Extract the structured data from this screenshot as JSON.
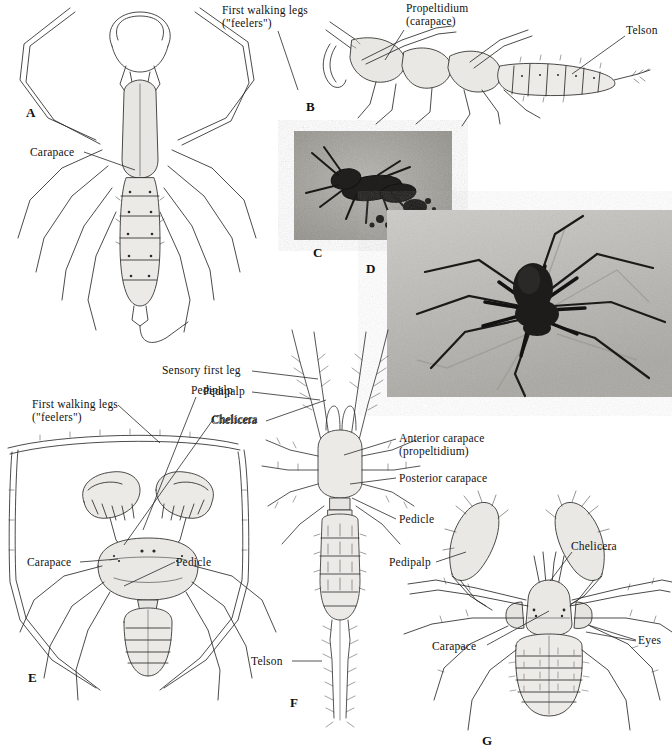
{
  "figure": {
    "background": "#ffffff",
    "ink": "#2a2a2a",
    "plates": [
      {
        "id": "A",
        "x": 26,
        "y": 105
      },
      {
        "id": "B",
        "x": 306,
        "y": 99
      },
      {
        "id": "C",
        "x": 313,
        "y": 245
      },
      {
        "id": "D",
        "x": 366,
        "y": 261
      },
      {
        "id": "E",
        "x": 28,
        "y": 670
      },
      {
        "id": "F",
        "x": 290,
        "y": 695
      },
      {
        "id": "G",
        "x": 482,
        "y": 733
      }
    ],
    "labels": [
      {
        "name": "label-carapace-a",
        "text": "Carapace",
        "x": 30,
        "y": 146,
        "leader": [
          [
            84,
            152
          ],
          [
            135,
            170
          ]
        ]
      },
      {
        "name": "label-first-walking-legs-b",
        "text": "First walking legs\n(\"feelers\")",
        "x": 222,
        "y": 4,
        "leader": [
          [
            278,
            31
          ],
          [
            298,
            90
          ]
        ]
      },
      {
        "name": "label-propeltidium-b",
        "text": "Propeltidium\n(carapace)",
        "x": 406,
        "y": 2,
        "leader": [
          [
            404,
            30
          ],
          [
            385,
            60
          ]
        ]
      },
      {
        "name": "label-telson-b",
        "text": "Telson",
        "x": 626,
        "y": 24,
        "leader": [
          [
            625,
            36
          ],
          [
            572,
            74
          ]
        ]
      },
      {
        "name": "label-sensory-first-leg-f",
        "text": "Sensory first leg",
        "x": 162,
        "y": 364,
        "leader": [
          [
            252,
            371
          ],
          [
            318,
            379
          ]
        ]
      },
      {
        "name": "label-pedipalp-f",
        "text": "Pedipalp",
        "x": 203,
        "y": 385,
        "leader": [
          [
            252,
            392
          ],
          [
            320,
            400
          ]
        ]
      },
      {
        "name": "label-chelicera-f",
        "text": "Chelicera",
        "x": 211,
        "y": 414,
        "leader": [
          [
            266,
            421
          ],
          [
            326,
            400
          ]
        ]
      },
      {
        "name": "label-anterior-carapace-f",
        "text": "Anterior carapace\n(propeltidium)",
        "x": 399,
        "y": 432,
        "leader": [
          [
            396,
            439
          ],
          [
            344,
            455
          ]
        ]
      },
      {
        "name": "label-posterior-carapace-f",
        "text": "Posterior carapace",
        "x": 399,
        "y": 472,
        "leader": [
          [
            396,
            478
          ],
          [
            350,
            484
          ]
        ]
      },
      {
        "name": "label-pedicle-f",
        "text": "Pedicle",
        "x": 399,
        "y": 513,
        "leader": [
          [
            396,
            519
          ],
          [
            352,
            498
          ]
        ]
      },
      {
        "name": "label-telson-f",
        "text": "Telson",
        "x": 251,
        "y": 655,
        "leader": [
          [
            292,
            661
          ],
          [
            322,
            661
          ]
        ]
      },
      {
        "name": "label-first-walking-legs-e",
        "text": "First walking legs\n(\"feelers\")",
        "x": 32,
        "y": 398,
        "leader": [
          [
            118,
            405
          ],
          [
            160,
            443
          ]
        ]
      },
      {
        "name": "label-pedipalp-e",
        "text": "Pedipalp",
        "x": 191,
        "y": 384,
        "leader": [
          [
            196,
            397
          ],
          [
            143,
            530
          ]
        ]
      },
      {
        "name": "label-chelicera-e",
        "text": "Chelicera",
        "x": 212,
        "y": 413,
        "leader": [
          [
            212,
            421
          ],
          [
            124,
            545
          ]
        ]
      },
      {
        "name": "label-carapace-e",
        "text": "Carapace",
        "x": 27,
        "y": 556,
        "leader": [
          [
            80,
            562
          ],
          [
            118,
            559
          ]
        ]
      },
      {
        "name": "label-pedicle-e",
        "text": "Pedicle",
        "x": 176,
        "y": 556,
        "leader": [
          [
            175,
            562
          ],
          [
            124,
            586
          ]
        ]
      },
      {
        "name": "label-pedipalp-g",
        "text": "Pedipalp",
        "x": 389,
        "y": 556,
        "leader": [
          [
            436,
            562
          ],
          [
            466,
            552
          ]
        ]
      },
      {
        "name": "label-chelicera-g",
        "text": "Chelicera",
        "x": 571,
        "y": 540,
        "leader": [
          [
            572,
            552
          ],
          [
            550,
            581
          ]
        ]
      },
      {
        "name": "label-carapace-g",
        "text": "Carapace",
        "x": 432,
        "y": 640,
        "leader": [
          [
            487,
            645
          ],
          [
            549,
            611
          ]
        ]
      },
      {
        "name": "label-eyes-g",
        "text": "Eyes",
        "x": 638,
        "y": 634,
        "leader": [
          [
            636,
            640
          ],
          [
            588,
            625
          ]
        ]
      },
      {
        "name": "label-eyes-g-2",
        "text": "",
        "x": 638,
        "y": 634,
        "leader": [
          [
            636,
            641
          ],
          [
            586,
            632
          ]
        ]
      }
    ],
    "panels": [
      {
        "id": "A",
        "type": "line-drawing",
        "subject": "whip scorpion dorsal view (Uropygi)"
      },
      {
        "id": "B",
        "type": "line-drawing",
        "subject": "schizomid lateral view"
      },
      {
        "id": "C",
        "type": "photograph",
        "subject": "schizomid on sand"
      },
      {
        "id": "D",
        "type": "photograph",
        "subject": "whip spider (Amblypygi)"
      },
      {
        "id": "E",
        "type": "line-drawing",
        "subject": "whip spider dorsal view (Amblypygi)"
      },
      {
        "id": "F",
        "type": "line-drawing",
        "subject": "palpigrade dorsal view"
      },
      {
        "id": "G",
        "type": "line-drawing",
        "subject": "ricinuleid/solifuge dorsal view"
      }
    ],
    "photo_c": {
      "x": 294,
      "y": 131,
      "w": 158,
      "h": 109,
      "tone": "#9a9a94"
    },
    "photo_d": {
      "x": 387,
      "y": 210,
      "w": 285,
      "h": 187,
      "tone": "#b9b8b4"
    }
  }
}
